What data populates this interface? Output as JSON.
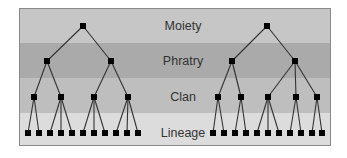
{
  "diagram": {
    "type": "kinship-hierarchy",
    "levels": [
      {
        "id": "moiety",
        "label": "Moiety",
        "band_color": "#c6c6c6",
        "y_top": 8,
        "y_bottom": 43,
        "node_y": 26
      },
      {
        "id": "phratry",
        "label": "Phratry",
        "band_color": "#aaaaaa",
        "y_top": 43,
        "y_bottom": 78,
        "node_y": 61
      },
      {
        "id": "clan",
        "label": "Clan",
        "band_color": "#bebebe",
        "y_top": 78,
        "y_bottom": 113,
        "node_y": 97
      },
      {
        "id": "lineage",
        "label": "Lineage",
        "band_color": "#dcdcdc",
        "y_top": 113,
        "y_bottom": 146,
        "node_y": 133
      }
    ],
    "frame": {
      "x": 19,
      "y": 8,
      "width": 312,
      "height": 138,
      "border_color": "#8a8a8a"
    },
    "label_x": 183,
    "node_size": 6,
    "node_color": "#000000",
    "line_color": "#333333",
    "trees": [
      {
        "name": "left-moiety",
        "moiety": 83,
        "phratries": [
          {
            "x": 47,
            "clans": [
              {
                "x": 34,
                "lineages": [
                  28,
                  39
                ]
              },
              {
                "x": 61,
                "lineages": [
                  50,
                  61,
                  72
                ]
              }
            ]
          },
          {
            "x": 111,
            "clans": [
              {
                "x": 94,
                "lineages": [
                  83,
                  94,
                  105
                ]
              },
              {
                "x": 128,
                "lineages": [
                  116,
                  127,
                  138
                ]
              }
            ]
          }
        ]
      },
      {
        "name": "right-moiety",
        "moiety": 267,
        "phratries": [
          {
            "x": 232,
            "clans": [
              {
                "x": 218,
                "lineages": [
                  213,
                  224
                ]
              },
              {
                "x": 241,
                "lineages": [
                  235,
                  246
                ]
              }
            ]
          },
          {
            "x": 295,
            "clans": [
              {
                "x": 268,
                "lineages": [
                  257,
                  268,
                  279
                ]
              },
              {
                "x": 296,
                "lineages": [
                  290,
                  301
                ]
              },
              {
                "x": 317,
                "lineages": [
                  312,
                  322
                ]
              }
            ]
          }
        ]
      }
    ]
  }
}
